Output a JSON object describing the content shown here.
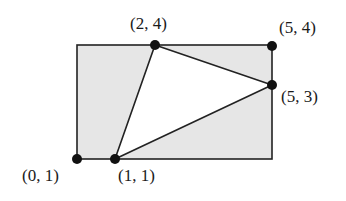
{
  "diagram": {
    "type": "geometry-figure",
    "colors": {
      "rect_fill": "#e6e6e6",
      "triangle_fill": "#ffffff",
      "stroke": "#222222",
      "dot": "#111111"
    },
    "rectangle": {
      "corners": [
        "(0, 1)",
        "(0, 4)",
        "(5, 4)",
        "(5, 1)"
      ]
    },
    "triangle": {
      "vertices": [
        "(2, 4)",
        "(5, 3)",
        "(1, 1)"
      ]
    },
    "points": [
      {
        "id": "p24",
        "label": "(2, 4)"
      },
      {
        "id": "p54",
        "label": "(5, 4)"
      },
      {
        "id": "p53",
        "label": "(5, 3)"
      },
      {
        "id": "p01",
        "label": "(0, 1)"
      },
      {
        "id": "p11",
        "label": "(1, 1)"
      }
    ]
  }
}
